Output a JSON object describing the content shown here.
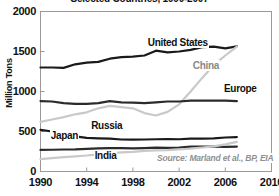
{
  "chart_data": {
    "type": "line",
    "title": "Selected Countries, 1990-2007",
    "xlabel": "",
    "ylabel": "Million Tons",
    "xlim": [
      1990,
      2010
    ],
    "ylim": [
      0,
      2000
    ],
    "xticks": [
      "1990",
      "1994",
      "1998",
      "2002",
      "2006",
      "2010"
    ],
    "xtick_values": [
      1990,
      1994,
      1998,
      2002,
      2006,
      2010
    ],
    "yticks": [
      "0",
      "500",
      "1000",
      "1500",
      "2000"
    ],
    "ytick_values": [
      0,
      500,
      1000,
      1500,
      2000
    ],
    "grid": false,
    "legend_position": "inline-labels",
    "x": [
      1990,
      1991,
      1992,
      1993,
      1994,
      1995,
      1996,
      1997,
      1998,
      1999,
      2000,
      2001,
      2002,
      2003,
      2004,
      2005,
      2006,
      2007
    ],
    "series": [
      {
        "name": "United States",
        "color": "#1a1a1a",
        "values": [
          1300,
          1300,
          1295,
          1340,
          1360,
          1370,
          1410,
          1430,
          1435,
          1450,
          1510,
          1490,
          1500,
          1520,
          1555,
          1560,
          1540,
          1565
        ]
      },
      {
        "name": "China",
        "color": "#c9c9c9",
        "values": [
          620,
          650,
          680,
          715,
          740,
          790,
          820,
          805,
          790,
          730,
          700,
          745,
          840,
          1000,
          1170,
          1330,
          1450,
          1560
        ]
      },
      {
        "name": "Europe",
        "color": "#2b2b2b",
        "values": [
          880,
          875,
          855,
          845,
          845,
          855,
          880,
          865,
          860,
          855,
          865,
          875,
          875,
          885,
          885,
          885,
          885,
          880
        ]
      },
      {
        "name": "Russia",
        "color": "#1a1a1a",
        "values": [
          520,
          500,
          465,
          440,
          420,
          415,
          412,
          400,
          398,
          400,
          403,
          405,
          403,
          410,
          412,
          415,
          425,
          430
        ]
      },
      {
        "name": "Japan",
        "color": "#2b2b2b",
        "values": [
          270,
          272,
          275,
          276,
          282,
          288,
          292,
          293,
          288,
          292,
          298,
          295,
          300,
          310,
          312,
          310,
          308,
          312
        ]
      },
      {
        "name": "India",
        "color": "#c9c9c9",
        "values": [
          155,
          168,
          180,
          190,
          200,
          215,
          228,
          238,
          245,
          258,
          265,
          268,
          275,
          285,
          300,
          315,
          340,
          370
        ]
      }
    ],
    "annotations": [
      {
        "text": "United States",
        "x_pct": 46.0,
        "y_pct": 16.0,
        "tone": "dark"
      },
      {
        "text": "China",
        "x_pct": 65.5,
        "y_pct": 30.0,
        "tone": "gray"
      },
      {
        "text": "Europe",
        "x_pct": 79.0,
        "y_pct": 44.5,
        "tone": "dark"
      },
      {
        "text": "Russia",
        "x_pct": 21.5,
        "y_pct": 68.0,
        "tone": "dark"
      },
      {
        "text": "Japan",
        "x_pct": 4.0,
        "y_pct": 74.0,
        "tone": "dark"
      },
      {
        "text": "India",
        "x_pct": 23.0,
        "y_pct": 86.5,
        "tone": "dark"
      }
    ],
    "source": "Source: Marland et al., BP, EIA"
  }
}
